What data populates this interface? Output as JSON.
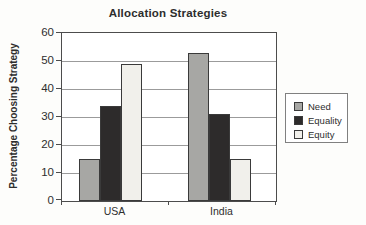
{
  "chart_data": {
    "type": "bar",
    "title": "Allocation Strategies",
    "ylabel": "Percentage Choosing Strategy",
    "xlabel": "",
    "categories": [
      "USA",
      "India"
    ],
    "series": [
      {
        "name": "Need",
        "color": "#a7a7a4",
        "values": [
          15,
          53
        ]
      },
      {
        "name": "Equality",
        "color": "#2d2b2b",
        "values": [
          34,
          31
        ]
      },
      {
        "name": "Equity",
        "color": "#f1f0eb",
        "values": [
          49,
          15
        ]
      }
    ],
    "ylim": [
      0,
      60
    ],
    "yticks": [
      0,
      10,
      20,
      30,
      40,
      50,
      60
    ],
    "grid": true,
    "legend_position": "right",
    "legend": [
      "Need",
      "Equality",
      "Equity"
    ],
    "colors": {
      "grid": "#9b9b9b",
      "border": "#4c4c4c",
      "bar_outline": "#3a3a3a",
      "legend_border": "#808080",
      "plot_background": "#ffffff"
    }
  }
}
